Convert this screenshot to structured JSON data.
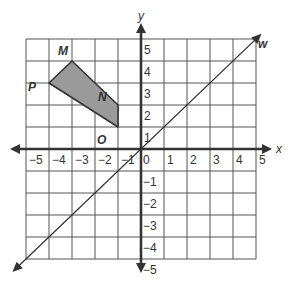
{
  "figure": {
    "type": "coordinate-plane",
    "axes": {
      "x_label": "x",
      "y_label": "y",
      "x_range": [
        -5,
        5
      ],
      "y_range": [
        -5,
        5
      ],
      "x_ticks": [
        "-5",
        "-4",
        "-3",
        "-2",
        "-1",
        "0",
        "1",
        "2",
        "3",
        "4",
        "5"
      ],
      "y_ticks_positive": [
        "1",
        "2",
        "3",
        "4",
        "5"
      ],
      "y_ticks_negative": [
        "-1",
        "-2",
        "-3",
        "-4",
        "-5"
      ],
      "grid": true
    },
    "polygon": {
      "name": "MNOP",
      "fill": "#9a9a9a",
      "stroke": "#333333",
      "vertices": [
        {
          "label": "M",
          "x": -3,
          "y": 4
        },
        {
          "label": "N",
          "x": -1,
          "y": 2
        },
        {
          "label": "O",
          "x": -1,
          "y": 1
        },
        {
          "label": "P",
          "x": -4,
          "y": 3
        }
      ]
    },
    "line": {
      "label": "w",
      "equation": "y = x"
    },
    "colors": {
      "grid": "#555555",
      "axis": "#333333",
      "text": "#333333"
    }
  }
}
